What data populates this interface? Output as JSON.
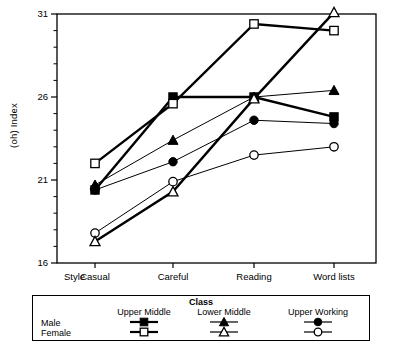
{
  "figure": {
    "y_axis_title": "(oh)  Index",
    "x_axis_title": "Style"
  },
  "axes": {
    "y_ticks_major": [
      "31",
      "26",
      "21",
      "16"
    ],
    "y_major_values": [
      31,
      26,
      21,
      16
    ],
    "y_minor_count_between": 4,
    "x_categories": [
      "Casual",
      "Careful",
      "Reading",
      "Word lists"
    ]
  },
  "legend": {
    "title": "Class",
    "columns": [
      "Upper Middle",
      "Lower Middle",
      "Upper Working"
    ],
    "rows": [
      "Male",
      "Female"
    ],
    "markers": {
      "upper_middle_male": "filled-square",
      "upper_middle_female": "open-square",
      "lower_middle_male": "filled-triangle",
      "lower_middle_female": "open-triangle",
      "upper_working_male": "filled-circle",
      "upper_working_female": "open-circle"
    }
  },
  "colors": {
    "ink": "#000000",
    "plot_background": "#ffffff",
    "frame": "#000000"
  },
  "chart_data": {
    "type": "line",
    "title": "",
    "xlabel": "Style",
    "ylabel": "(oh)  Index",
    "categories": [
      "Casual",
      "Careful",
      "Reading",
      "Word lists"
    ],
    "ylim": [
      16,
      31
    ],
    "yticks": [
      16,
      21,
      26,
      31
    ],
    "grid": false,
    "legend_position": "below",
    "series": [
      {
        "name": "Upper Middle Male",
        "class": "Upper Middle",
        "sex": "Male",
        "marker": "filled-square",
        "line_weight": "thick",
        "values": [
          20.4,
          26.0,
          26.0,
          24.8
        ]
      },
      {
        "name": "Upper Middle Female",
        "class": "Upper Middle",
        "sex": "Female",
        "marker": "open-square",
        "line_weight": "thick",
        "values": [
          22.0,
          25.6,
          30.4,
          30.0
        ]
      },
      {
        "name": "Lower Middle Male",
        "class": "Lower Middle",
        "sex": "Male",
        "marker": "filled-triangle",
        "line_weight": "thin",
        "values": [
          20.7,
          23.4,
          26.0,
          26.4
        ]
      },
      {
        "name": "Lower Middle Female",
        "class": "Lower Middle",
        "sex": "Female",
        "marker": "open-triangle",
        "line_weight": "thick",
        "values": [
          17.3,
          20.3,
          25.9,
          31.1
        ]
      },
      {
        "name": "Upper Working Male",
        "class": "Upper Working",
        "sex": "Male",
        "marker": "filled-circle",
        "line_weight": "thin",
        "values": [
          20.4,
          22.1,
          24.6,
          24.4
        ]
      },
      {
        "name": "Upper Working Female",
        "class": "Upper Working",
        "sex": "Female",
        "marker": "open-circle",
        "line_weight": "thin",
        "values": [
          17.8,
          20.9,
          22.5,
          23.0
        ]
      }
    ]
  }
}
